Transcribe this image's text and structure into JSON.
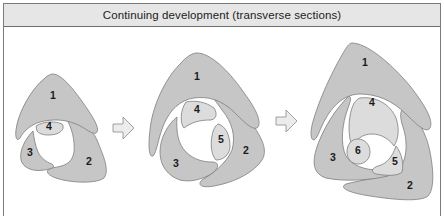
{
  "header": {
    "title": "Continuing development (transverse sections)"
  },
  "colors": {
    "header_bg": "#e6e6e6",
    "border": "#7a7a7a",
    "shape_fill": "#c6c6c6",
    "shape_light_fill": "#dcdcdc",
    "arrow_fill": "#ececec"
  },
  "stages": [
    {
      "name": "stage-1",
      "labels": [
        "1",
        "2",
        "3",
        "4"
      ]
    },
    {
      "name": "stage-2",
      "labels": [
        "1",
        "2",
        "3",
        "4",
        "5"
      ]
    },
    {
      "name": "stage-3",
      "labels": [
        "1",
        "2",
        "3",
        "4",
        "5",
        "6"
      ]
    }
  ],
  "arrows": [
    {
      "name": "arrow-right-1",
      "icon": "arrow-right-icon"
    },
    {
      "name": "arrow-right-2",
      "icon": "arrow-right-icon"
    }
  ]
}
